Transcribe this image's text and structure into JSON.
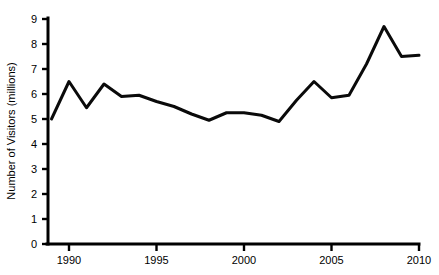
{
  "chart_data": {
    "type": "line",
    "title": "",
    "xlabel": "",
    "ylabel": "Number of Visitors (millions)",
    "xlim": [
      1988.8,
      2010
    ],
    "ylim": [
      0,
      9
    ],
    "grid": false,
    "legend": null,
    "x_ticks": [
      1990,
      1995,
      2000,
      2005,
      2010
    ],
    "x_tick_labels": [
      "1990",
      "1995",
      "2000",
      "2005",
      "2010"
    ],
    "y_ticks": [
      0,
      1,
      2,
      3,
      4,
      5,
      6,
      7,
      8,
      9
    ],
    "y_tick_labels": [
      "0",
      "1",
      "2",
      "3",
      "4",
      "5",
      "6",
      "7",
      "8",
      "9"
    ],
    "series": [
      {
        "name": "Number of Visitors",
        "color": "#0a0a0a",
        "x": [
          1989,
          1990,
          1991,
          1992,
          1993,
          1994,
          1995,
          1996,
          1997,
          1998,
          1999,
          2000,
          2001,
          2002,
          2003,
          2004,
          2005,
          2006,
          2007,
          2008,
          2009,
          2010
        ],
        "values": [
          5.0,
          6.5,
          5.45,
          6.4,
          5.9,
          5.95,
          5.7,
          5.5,
          5.2,
          4.95,
          5.25,
          5.25,
          5.15,
          4.9,
          5.75,
          6.5,
          5.85,
          5.95,
          7.2,
          8.7,
          7.5,
          7.55
        ]
      }
    ]
  }
}
